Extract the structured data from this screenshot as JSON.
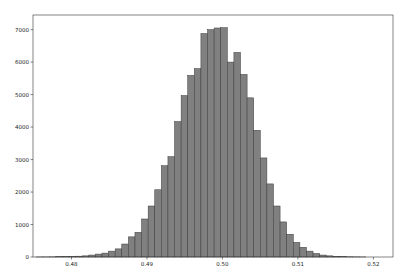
{
  "chart_data": {
    "type": "bar",
    "subtype": "histogram",
    "title": "",
    "xlabel": "",
    "ylabel": "",
    "xlim": [
      0.4749,
      0.5226
    ],
    "ylim": [
      0,
      7450
    ],
    "xticks": [
      0.48,
      0.49,
      0.5,
      0.51,
      0.52
    ],
    "xtick_labels": [
      "0.48",
      "0.49",
      "0.50",
      "0.51",
      "0.52"
    ],
    "yticks": [
      0,
      1000,
      2000,
      3000,
      4000,
      5000,
      6000,
      7000
    ],
    "ytick_labels": [
      "0",
      "1000",
      "2000",
      "3000",
      "4000",
      "5000",
      "6000",
      "7000"
    ],
    "grid": false,
    "legend": null,
    "bar_color": "#808080",
    "edge_color": "#3a3a3a",
    "bin_start": 0.4753,
    "bin_width": 0.000874,
    "values": [
      2,
      3,
      5,
      8,
      12,
      18,
      25,
      35,
      60,
      90,
      120,
      180,
      250,
      400,
      620,
      760,
      1170,
      1570,
      2070,
      2810,
      3090,
      4170,
      4970,
      5590,
      5800,
      6880,
      7000,
      7050,
      7060,
      6000,
      6300,
      5620,
      4900,
      3900,
      3050,
      2250,
      1570,
      1080,
      700,
      450,
      300,
      180,
      110,
      60,
      35,
      20,
      12,
      7,
      4,
      2
    ]
  }
}
